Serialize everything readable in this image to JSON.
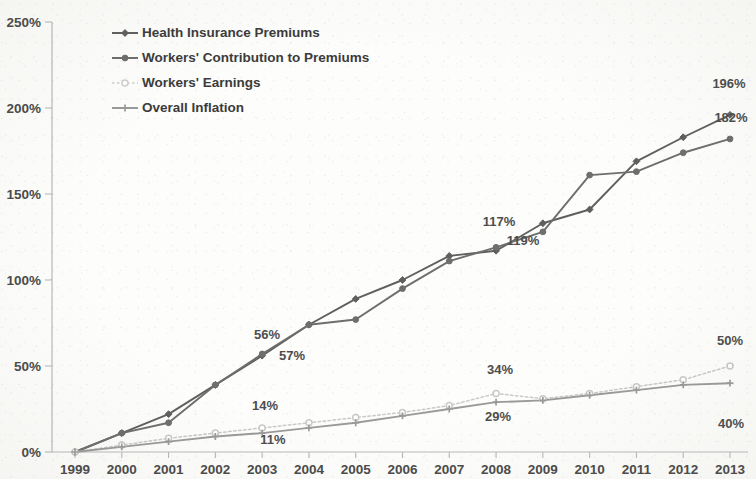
{
  "chart_data": {
    "type": "line",
    "title": "",
    "subtitle": "",
    "xlabel": "",
    "ylabel": "",
    "x": [
      1999,
      2000,
      2001,
      2002,
      2003,
      2004,
      2005,
      2006,
      2007,
      2008,
      2009,
      2010,
      2011,
      2012,
      2013
    ],
    "xtick_labels": [
      "1999",
      "2000",
      "2001",
      "2002",
      "2003",
      "2004",
      "2005",
      "2006",
      "2007",
      "2008",
      "2009",
      "2010",
      "2011",
      "2012",
      "2013"
    ],
    "ytick_labels": [
      "0%",
      "50%",
      "100%",
      "150%",
      "200%",
      "250%"
    ],
    "ytick_values": [
      0,
      50,
      100,
      150,
      200,
      250
    ],
    "ylim": [
      0,
      250
    ],
    "grid": false,
    "legend_position": "top-left-inside",
    "series": [
      {
        "name": "Health Insurance Premiums",
        "color": "#5f5f5f",
        "marker": "diamond",
        "dash": "solid",
        "values": [
          0,
          11,
          22,
          39,
          56,
          74,
          89,
          100,
          114,
          117,
          133,
          141,
          169,
          183,
          196
        ]
      },
      {
        "name": "Workers' Contribution to Premiums",
        "color": "#6e6e6e",
        "marker": "circle",
        "dash": "solid",
        "values": [
          0,
          11,
          17,
          39,
          57,
          74,
          77,
          95,
          111,
          119,
          128,
          161,
          163,
          174,
          182
        ]
      },
      {
        "name": "Workers' Earnings",
        "color": "#c9c9c9",
        "marker": "circle-open",
        "dash": "dotted",
        "values": [
          0,
          4,
          8,
          11,
          14,
          17,
          20,
          23,
          27,
          34,
          31,
          34,
          38,
          42,
          50
        ]
      },
      {
        "name": "Overall Inflation",
        "color": "#9a9a9a",
        "marker": "cross",
        "dash": "solid",
        "values": [
          0,
          3,
          6,
          9,
          11,
          14,
          17,
          21,
          25,
          29,
          30,
          33,
          36,
          39,
          40
        ]
      }
    ],
    "point_labels": [
      {
        "text": "56%",
        "year": 2003,
        "series": "Health Insurance Premiums",
        "x": 267,
        "y": 339
      },
      {
        "text": "57%",
        "year": 2003,
        "series": "Workers' Contribution to Premiums",
        "x": 292,
        "y": 360
      },
      {
        "text": "14%",
        "year": 2003,
        "series": "Workers' Earnings",
        "x": 265,
        "y": 410
      },
      {
        "text": "11%",
        "year": 2003,
        "series": "Overall Inflation",
        "x": 273,
        "y": 444
      },
      {
        "text": "117%",
        "year": 2008,
        "series": "Health Insurance Premiums",
        "x": 499,
        "y": 226
      },
      {
        "text": "119%",
        "year": 2008,
        "series": "Workers' Contribution to Premiums",
        "x": 523,
        "y": 245
      },
      {
        "text": "34%",
        "year": 2008,
        "series": "Workers' Earnings",
        "x": 500,
        "y": 374
      },
      {
        "text": "29%",
        "year": 2008,
        "series": "Overall Inflation",
        "x": 498,
        "y": 421
      },
      {
        "text": "196%",
        "year": 2013,
        "series": "Workers' Contribution to Premiums",
        "x": 729,
        "y": 88
      },
      {
        "text": "182%",
        "year": 2013,
        "series": "Health Insurance Premiums",
        "x": 731,
        "y": 122
      },
      {
        "text": "50%",
        "year": 2013,
        "series": "Workers' Earnings",
        "x": 730,
        "y": 345
      },
      {
        "text": "40%",
        "year": 2013,
        "series": "Overall Inflation",
        "x": 731,
        "y": 428
      }
    ]
  },
  "legend": {
    "items": [
      {
        "label": "Health Insurance Premiums",
        "color": "#5f5f5f",
        "marker": "diamond",
        "dash": "solid"
      },
      {
        "label": "Workers' Contribution to Premiums",
        "color": "#6e6e6e",
        "marker": "circle",
        "dash": "solid"
      },
      {
        "label": "Workers' Earnings",
        "color": "#cfcfcf",
        "marker": "circle-open",
        "dash": "dotted"
      },
      {
        "label": "Overall Inflation",
        "color": "#9a9a9a",
        "marker": "cross",
        "dash": "solid"
      }
    ]
  },
  "axes": {
    "y_labels": [
      "250%",
      "200%",
      "150%",
      "100%",
      "50%",
      "0%"
    ],
    "x_labels": [
      "1999",
      "2000",
      "2001",
      "2002",
      "2003",
      "2004",
      "2005",
      "2006",
      "2007",
      "2008",
      "2009",
      "2010",
      "2011",
      "2012",
      "2013"
    ]
  }
}
